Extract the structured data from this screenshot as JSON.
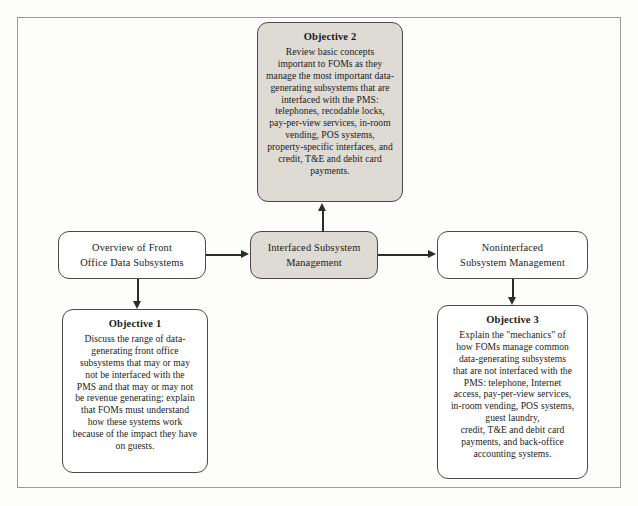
{
  "diagram_data": {
    "type": "flowchart",
    "title": "Front Office Data Subsystems learning-objective flowchart",
    "nodes": [
      {
        "id": "objective2",
        "title": "Objective 2",
        "body": "Review basic concepts important to FOMs as they manage the most important data-generating subsystems that are interfaced with the PMS: telephones, recodable locks, pay-per-view services, in-room vending, POS systems, property-specific interfaces, and credit, T&E and debit card payments.",
        "shaded": true
      },
      {
        "id": "overview",
        "title": "",
        "body": "Overview of Front Office Data Subsystems",
        "shaded": false
      },
      {
        "id": "interfaced",
        "title": "",
        "body": "Interfaced Subsystem Management",
        "shaded": true
      },
      {
        "id": "noninterfaced",
        "title": "",
        "body": "Noninterfaced Subsystem Management",
        "shaded": false
      },
      {
        "id": "objective1",
        "title": "Objective 1",
        "body": "Discuss the range of data-generating front office subsystems that may or may not be interfaced with the PMS and that may or may not be revenue generating; explain that FOMs must understand how these systems work because of the impact they have on guests.",
        "shaded": false
      },
      {
        "id": "objective3",
        "title": "Objective 3",
        "body": "Explain the \"mechanics\" of how FOMs manage common data-generating subsystems that are not interfaced with the PMS: telephone, Internet access, pay-per-view services, in-room vending, POS systems, guest laundry, credit, T&E and debit card payments, and back-office accounting systems.",
        "shaded": false
      }
    ],
    "edges": [
      {
        "from": "overview",
        "to": "interfaced",
        "direction": "right"
      },
      {
        "from": "interfaced",
        "to": "noninterfaced",
        "direction": "right"
      },
      {
        "from": "interfaced",
        "to": "objective2",
        "direction": "up"
      },
      {
        "from": "overview",
        "to": "objective1",
        "direction": "down"
      },
      {
        "from": "noninterfaced",
        "to": "objective3",
        "direction": "down"
      }
    ],
    "colors": {
      "shaded_fill": "#dedad4",
      "plain_fill": "#ffffff",
      "border": "#4a4a4a",
      "frame_border": "#9c9a98",
      "text": "#1b1b1b",
      "page_background": "#fdfdfc"
    }
  },
  "nodes": {
    "objective2": {
      "title": "Objective 2",
      "line1": "Review basic concepts",
      "line2": "important to FOMs as they",
      "line3": "manage the most important data-",
      "line4": "generating subsystems that are",
      "line5": "interfaced with the PMS:",
      "line6": "telephones, recodable locks,",
      "line7": "pay-per-view services, in-room",
      "line8": "vending, POS systems,",
      "line9": "property-specific interfaces, and",
      "line10": "credit, T&E and debit card",
      "line11": "payments."
    },
    "overview": {
      "line1": "Overview of Front",
      "line2": "Office Data Subsystems"
    },
    "interfaced": {
      "line1": "Interfaced Subsystem",
      "line2": "Management"
    },
    "noninterfaced": {
      "line1": "Noninterfaced",
      "line2": "Subsystem Management"
    },
    "objective1": {
      "title": "Objective 1",
      "line1": "Discuss the range of data-",
      "line2": "generating front office",
      "line3": "subsystems that may or may",
      "line4": "not be interfaced with the",
      "line5": "PMS and that may or may not",
      "line6": "be revenue generating; explain",
      "line7": "that FOMs must understand",
      "line8": "how these systems work",
      "line9": "because of the impact they have",
      "line10": "on guests."
    },
    "objective3": {
      "title": "Objective 3",
      "line1": "Explain the \"mechanics\" of",
      "line2": "how FOMs manage common",
      "line3": "data-generating subsystems",
      "line4": "that are not interfaced with the",
      "line5": "PMS: telephone, Internet",
      "line6": "access, pay-per-view services,",
      "line7": "in-room vending, POS systems,",
      "line8": "guest laundry,",
      "line9": "credit, T&E and debit card",
      "line10": "payments, and back-office",
      "line11": "accounting systems."
    }
  }
}
